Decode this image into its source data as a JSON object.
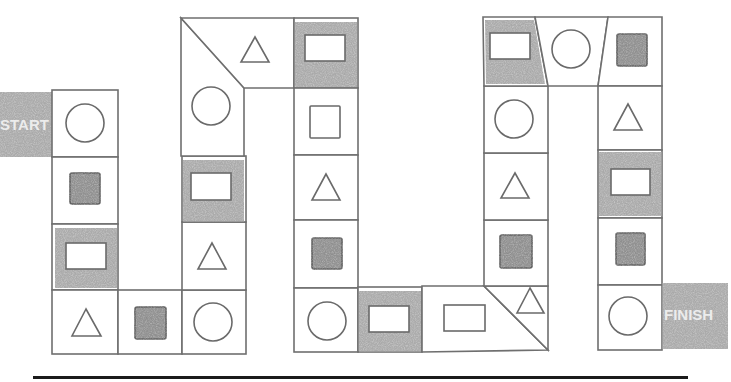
{
  "board": {
    "start_label": "START",
    "finish_label": "FINISH",
    "colors": {
      "line": "#6f6f6f",
      "shade": "#a9a9a9",
      "filled_square": "#9c9c9c",
      "underline": "#1b1b1b"
    },
    "path": [
      {
        "index": 0,
        "type": "start",
        "label": "START"
      },
      {
        "index": 1,
        "shape": "circle",
        "shaded_cell": false
      },
      {
        "index": 2,
        "shape": "filled-square",
        "shaded_cell": false
      },
      {
        "index": 3,
        "shape": "rectangle",
        "shaded_cell": true
      },
      {
        "index": 4,
        "shape": "triangle",
        "shaded_cell": false
      },
      {
        "index": 5,
        "shape": "filled-square",
        "shaded_cell": false
      },
      {
        "index": 6,
        "shape": "circle",
        "shaded_cell": false
      },
      {
        "index": 7,
        "shape": "triangle",
        "shaded_cell": false
      },
      {
        "index": 8,
        "shape": "rectangle",
        "shaded_cell": true
      },
      {
        "index": 9,
        "shape": "circle",
        "shaded_cell": false
      },
      {
        "index": 10,
        "shape": "triangle",
        "shaded_cell": false
      },
      {
        "index": 11,
        "shape": "rectangle",
        "shaded_cell": true
      },
      {
        "index": 12,
        "shape": "square",
        "shaded_cell": false
      },
      {
        "index": 13,
        "shape": "triangle",
        "shaded_cell": false
      },
      {
        "index": 14,
        "shape": "filled-square",
        "shaded_cell": false
      },
      {
        "index": 15,
        "shape": "circle",
        "shaded_cell": false
      },
      {
        "index": 16,
        "shape": "rectangle",
        "shaded_cell": true
      },
      {
        "index": 17,
        "shape": "rectangle",
        "shaded_cell": false
      },
      {
        "index": 18,
        "shape": "triangle",
        "shaded_cell": false
      },
      {
        "index": 19,
        "shape": "filled-square",
        "shaded_cell": false
      },
      {
        "index": 20,
        "shape": "triangle",
        "shaded_cell": false
      },
      {
        "index": 21,
        "shape": "circle",
        "shaded_cell": false
      },
      {
        "index": 22,
        "shape": "rectangle",
        "shaded_cell": true
      },
      {
        "index": 23,
        "shape": "circle",
        "shaded_cell": false
      },
      {
        "index": 24,
        "shape": "filled-square",
        "shaded_cell": false
      },
      {
        "index": 25,
        "shape": "triangle",
        "shaded_cell": false
      },
      {
        "index": 26,
        "shape": "rectangle",
        "shaded_cell": true
      },
      {
        "index": 27,
        "shape": "filled-square",
        "shaded_cell": false
      },
      {
        "index": 28,
        "shape": "circle",
        "shaded_cell": false
      },
      {
        "index": 29,
        "type": "finish",
        "label": "FINISH"
      }
    ]
  }
}
